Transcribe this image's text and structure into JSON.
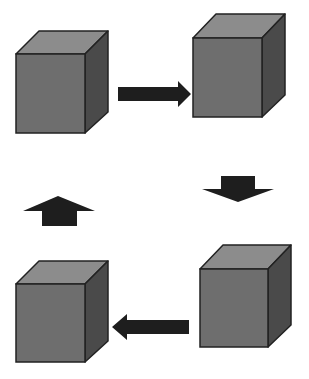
{
  "diagram": {
    "type": "cycle",
    "colors": {
      "background": "#ffffff",
      "cube_front": "#6e6e6e",
      "cube_top": "#8c8c8c",
      "cube_side": "#4a4a4a",
      "cube_outline": "#222222",
      "arrow": "#1e1e1e"
    },
    "nodes": [
      {
        "id": "cube-top-left",
        "position": "top-left"
      },
      {
        "id": "cube-top-right",
        "position": "top-right"
      },
      {
        "id": "cube-bottom-right",
        "position": "bottom-right"
      },
      {
        "id": "cube-bottom-left",
        "position": "bottom-left"
      }
    ],
    "edges": [
      {
        "from": "cube-top-left",
        "to": "cube-top-right",
        "direction": "right"
      },
      {
        "from": "cube-top-right",
        "to": "cube-bottom-right",
        "direction": "down"
      },
      {
        "from": "cube-bottom-right",
        "to": "cube-bottom-left",
        "direction": "left"
      },
      {
        "from": "cube-bottom-left",
        "to": "cube-top-left",
        "direction": "up"
      }
    ]
  }
}
